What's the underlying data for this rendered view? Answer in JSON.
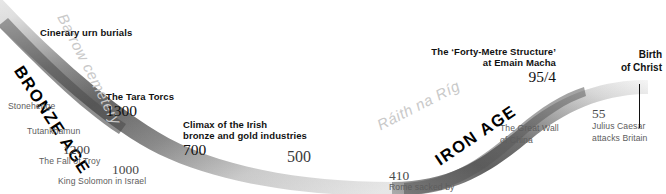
{
  "figure": {
    "type": "timeline",
    "orientation": "horizontal",
    "direction": "left-to-right (earlier to later)",
    "background_color": "#ffffff"
  },
  "ribbon": {
    "shape": "s-curve-band",
    "fill_dark": "#6e6e6e",
    "fill_mid": "#b5b5b5",
    "fill_light": "#ededed",
    "segments": [
      {
        "label": "BRONZE AGE",
        "position": "left-descending"
      },
      {
        "label": "IRON AGE",
        "position": "right-ascending"
      }
    ]
  },
  "eras": [
    {
      "name": "era-bronze-age",
      "label": "BRONZE AGE"
    },
    {
      "name": "era-iron-age",
      "label": "IRON AGE"
    }
  ],
  "sites": [
    {
      "name": "site-barrow-cemetery",
      "label": "Barrow cemetery"
    },
    {
      "name": "site-raith-na-rig",
      "label": "Ráith na Ríg"
    }
  ],
  "irish_events": [
    {
      "name": "cinerary-urn-burials",
      "title": "Cinerary urn burials",
      "date": ""
    },
    {
      "name": "tara-torcs",
      "title": "The Tara Torcs",
      "date": "1300"
    },
    {
      "name": "climax-bronze-gold",
      "title_line1": "Climax of the Irish",
      "title_line2": "bronze and gold industries",
      "date": "700"
    },
    {
      "name": "forty-metre-structure",
      "title_line1": "The ‘Forty-Metre Structure’",
      "title_line2": "at Emain Macha",
      "date": "95/4"
    }
  ],
  "scale_dates": [
    {
      "name": "scale-1200",
      "value": "1200"
    },
    {
      "name": "scale-1000",
      "value": "1000"
    },
    {
      "name": "scale-500",
      "value": "500"
    },
    {
      "name": "scale-410",
      "value": "410"
    },
    {
      "name": "scale-55",
      "value": "55"
    }
  ],
  "world_events": [
    {
      "name": "world-stonehenge",
      "label": "Stonehenge"
    },
    {
      "name": "world-tutankhamun",
      "label": "Tutankhamun"
    },
    {
      "name": "world-fall-of-troy",
      "label": "The Fall of Troy",
      "date": "1200"
    },
    {
      "name": "world-king-solomon",
      "label": "King Solomon in Israel",
      "date": "1000"
    },
    {
      "name": "world-great-wall-line1",
      "label": "The Great Wall"
    },
    {
      "name": "world-great-wall-line2",
      "label": "of China"
    },
    {
      "name": "world-rome-sacked",
      "label": "Rome sacked by",
      "date": "410"
    },
    {
      "name": "world-julius-caesar-line1",
      "label": "Julius Caesar"
    },
    {
      "name": "world-julius-caesar-line2",
      "label": "attacks Britain",
      "date": "55"
    }
  ],
  "marker": {
    "name": "birth-of-christ",
    "title_line1": "Birth",
    "title_line2": "of Christ"
  }
}
